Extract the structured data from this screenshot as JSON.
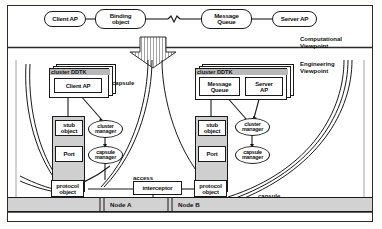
{
  "figure": {
    "viewpoints": {
      "computational": "Computational\nViewpoint",
      "engineering": "Engineering\nViewpoint"
    },
    "computational_row": {
      "client_ap": "Client AP",
      "binding_object": "Binding\nobject",
      "message_queue": "Message\nQueue",
      "server_ap": "Server AP",
      "break_symbol": "squiggle-break"
    },
    "transition_arrow": "refinement-down-arrow",
    "left_node": {
      "ddtk_header": "cluster DDTK",
      "application": "Client AP",
      "capsule_label": "capsule",
      "stub_object": "stub\nobject",
      "port": "Port",
      "protocol_object": "protocol\nobject",
      "cluster_manager": "cluster\nmanager",
      "capsule_manager": "capsule\nmanager",
      "node_label": "Node A"
    },
    "right_node": {
      "ddtk_header": "cluster DDTK",
      "application_a": "Message\nQueue",
      "application_b": "Server\nAP",
      "capsule_label": "capsule",
      "stub_object": "stub\nobject",
      "port": "Port",
      "protocol_object": "protocol\nobject",
      "cluster_manager": "cluster\nmanager",
      "capsule_manager": "capsule\nmanager",
      "node_label": "Node B"
    },
    "middle": {
      "access_label": "access",
      "interceptor": "interceptor"
    },
    "colors": {
      "ink": "#1a1a1a",
      "shade": "#cfcfcf",
      "header_shade": "#b9b9b9",
      "band_shade": "#d2d2d2",
      "paper": "#ffffff"
    }
  }
}
